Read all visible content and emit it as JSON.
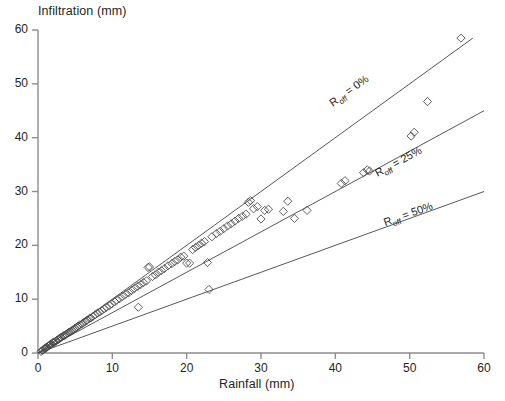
{
  "chart_data": {
    "type": "scatter",
    "title": "",
    "xlabel": "Rainfall (mm)",
    "ylabel": "Infiltration (mm)",
    "xlim": [
      0,
      60
    ],
    "ylim": [
      0,
      60
    ],
    "xticks": [
      0,
      10,
      20,
      30,
      40,
      50,
      60
    ],
    "yticks": [
      0,
      10,
      20,
      30,
      40,
      50,
      60
    ],
    "grid": false,
    "legend": "none",
    "marker": "open-diamond",
    "marker_color": "#444444",
    "line_color": "#444444",
    "reference_lines": [
      {
        "label": "R_off = 0%",
        "label_html": "R<sub>off</sub> = 0%",
        "slope": 1.0,
        "x_from": 0,
        "x_to": 58.5,
        "y_from": 0,
        "y_to": 58.5,
        "label_x": 42.5,
        "label_y": 46.0
      },
      {
        "label": "R_off = 25%",
        "label_html": "R<sub>off</sub> = 25%",
        "slope": 0.75,
        "x_from": 0,
        "x_to": 60,
        "y_from": 0,
        "y_to": 45,
        "label_x": 49.0,
        "label_y": 33.0
      },
      {
        "label": "R_off = 50%",
        "label_html": "R<sub>off</sub> = 50%",
        "slope": 0.5,
        "x_from": 0,
        "x_to": 60,
        "y_from": 0,
        "y_to": 30,
        "label_x": 50.0,
        "label_y": 24.0
      }
    ],
    "x": [
      0.4,
      0.6,
      0.7,
      0.9,
      1.0,
      1.1,
      1.2,
      1.4,
      1.5,
      1.6,
      1.7,
      1.8,
      2.0,
      2.1,
      2.2,
      2.4,
      2.5,
      2.7,
      2.8,
      3.0,
      3.1,
      3.3,
      3.5,
      3.6,
      3.8,
      4.0,
      4.2,
      4.4,
      4.6,
      4.8,
      5.0,
      5.2,
      5.4,
      5.6,
      5.9,
      6.1,
      6.4,
      6.6,
      6.9,
      7.1,
      7.4,
      7.7,
      8.0,
      8.3,
      8.6,
      8.9,
      9.2,
      9.6,
      9.9,
      10.3,
      10.6,
      11.0,
      11.4,
      11.8,
      12.2,
      12.6,
      13.0,
      13.4,
      13.5,
      13.8,
      14.2,
      14.6,
      14.8,
      15.0,
      15.4,
      15.8,
      16.2,
      16.6,
      17.0,
      17.5,
      18.0,
      18.4,
      18.8,
      19.2,
      19.6,
      20.0,
      20.4,
      20.8,
      21.2,
      21.6,
      22.0,
      22.4,
      22.8,
      23.0,
      23.4,
      24.0,
      24.5,
      25.0,
      25.5,
      26.0,
      26.5,
      27.0,
      27.5,
      28.0,
      28.3,
      28.6,
      29.0,
      29.5,
      30.0,
      30.5,
      31.0,
      33.0,
      33.6,
      34.5,
      36.2,
      40.8,
      41.3,
      43.8,
      44.3,
      44.6,
      50.2,
      50.6,
      52.4,
      56.9
    ],
    "y": [
      0.3,
      0.5,
      0.6,
      0.8,
      0.9,
      1.0,
      1.1,
      1.3,
      1.4,
      1.5,
      1.6,
      1.7,
      1.9,
      2.0,
      2.0,
      2.2,
      2.3,
      2.5,
      2.6,
      2.8,
      2.9,
      3.1,
      3.2,
      3.3,
      3.5,
      3.7,
      3.9,
      4.0,
      4.2,
      4.4,
      4.6,
      4.8,
      5.0,
      5.2,
      5.4,
      5.6,
      5.9,
      6.1,
      6.4,
      6.5,
      6.8,
      7.1,
      7.4,
      7.6,
      7.9,
      8.2,
      8.5,
      8.8,
      9.1,
      9.5,
      9.8,
      10.1,
      10.5,
      10.9,
      11.2,
      11.6,
      12.0,
      12.4,
      8.5,
      12.7,
      13.1,
      13.4,
      15.9,
      16.0,
      14.2,
      14.5,
      15.0,
      15.3,
      15.7,
      16.2,
      16.6,
      17.0,
      17.3,
      17.8,
      18.0,
      16.7,
      16.7,
      19.2,
      19.6,
      20.0,
      20.4,
      20.7,
      16.8,
      11.8,
      21.6,
      22.2,
      22.6,
      23.1,
      23.6,
      24.0,
      24.5,
      25.0,
      25.4,
      25.8,
      28.0,
      28.3,
      26.8,
      27.2,
      24.9,
      26.5,
      26.7,
      26.3,
      28.2,
      25.0,
      26.5,
      31.5,
      32.0,
      33.5,
      34.0,
      33.8,
      40.3,
      41.0,
      46.7,
      58.5
    ]
  },
  "axis": {
    "ytick_labels": [
      "60",
      "50",
      "40",
      "30",
      "20",
      "10",
      "0"
    ],
    "xtick_labels": [
      "0",
      "10",
      "20",
      "30",
      "40",
      "50",
      "60"
    ]
  }
}
